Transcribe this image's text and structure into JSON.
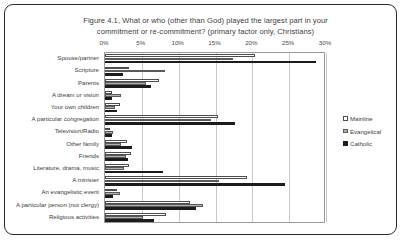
{
  "title": {
    "line1": "Figure 4.1, What or who (other than God) played the largest part in your",
    "line2": "commitment or re-commitment? (primary factor only, Christians)"
  },
  "legend": {
    "position": "right",
    "items": [
      {
        "label": "Mainline",
        "color": "#ffffff"
      },
      {
        "label": "Evangelical",
        "color": "#b0b0b0"
      },
      {
        "label": "Catholic",
        "color": "#1c1c1c"
      }
    ]
  },
  "chart_data": {
    "type": "bar",
    "orientation": "horizontal",
    "title": "Figure 4.1, What or who (other than God) played the largest part in your commitment or re-commitment? (primary factor only, Christians)",
    "xlabel": "",
    "ylabel": "",
    "xlim": [
      0,
      30
    ],
    "xticks": [
      0,
      5,
      10,
      15,
      20,
      25,
      30
    ],
    "xticklabels": [
      "0%",
      "5%",
      "10%",
      "15%",
      "20%",
      "25%",
      "30%"
    ],
    "grid": true,
    "categories": [
      "Spouse/partner",
      "Scripture",
      "Parents",
      "A dream or vision",
      "Your own children",
      "A particular congregation",
      "Television/Radio",
      "Other family",
      "Friends",
      "Literature, drama, music",
      "A minister",
      "An evangelistic event",
      "A particular person (not clergy)",
      "Religious activities"
    ],
    "series": [
      {
        "name": "Mainline",
        "values": [
          20.3,
          3.2,
          7.3,
          0.9,
          2.1,
          15.4,
          0.7,
          3.0,
          3.5,
          3.3,
          19.3,
          1.6,
          11.5,
          8.3
        ]
      },
      {
        "name": "Evangelical",
        "values": [
          17.4,
          8.2,
          5.6,
          2.2,
          1.4,
          14.4,
          1.1,
          2.2,
          2.9,
          2.6,
          15.5,
          2.1,
          13.3,
          5.2
        ]
      },
      {
        "name": "Catholic",
        "values": [
          28.6,
          2.4,
          6.3,
          1.0,
          1.6,
          17.6,
          0.9,
          3.6,
          3.1,
          7.9,
          24.4,
          1.1,
          12.4,
          6.6
        ]
      }
    ]
  }
}
